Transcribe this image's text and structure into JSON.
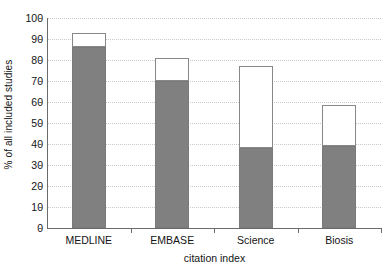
{
  "chart_data": {
    "type": "bar",
    "subtype": "stacked",
    "title": "",
    "xlabel": "citation index",
    "ylabel": "% of all included studies",
    "categories": [
      "MEDLINE",
      "EMBASE",
      "Science",
      "Biosis"
    ],
    "ylim": [
      0,
      100
    ],
    "yticks": [
      0,
      10,
      20,
      30,
      40,
      50,
      60,
      70,
      80,
      90,
      100
    ],
    "ytick_labels": [
      "0",
      "10",
      "20",
      "30",
      "40",
      "50",
      "60",
      "70",
      "80",
      "90",
      "100"
    ],
    "grid": true,
    "grid_orientation": "horizontal",
    "grid_style": "dotted",
    "legend": null,
    "series": [
      {
        "name": "grey-segment",
        "color": "#808080",
        "values": [
          86,
          70,
          38,
          39
        ]
      },
      {
        "name": "white-segment",
        "color": "#ffffff",
        "values": [
          7,
          11,
          39,
          19.5
        ]
      }
    ],
    "totals": [
      93,
      81,
      77,
      58.5
    ]
  },
  "axis": {
    "y_title": "% of all included studies",
    "x_title": "citation index"
  }
}
